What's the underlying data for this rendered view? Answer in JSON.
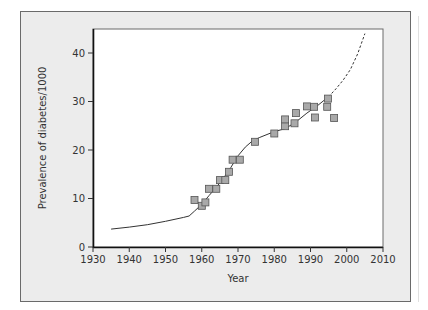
{
  "chart_data": {
    "type": "scatter",
    "title": "",
    "xlabel": "Year",
    "ylabel": "Prevalence of diabetes/1000",
    "xlim": [
      1930,
      2010
    ],
    "ylim": [
      0,
      45
    ],
    "x_ticks": [
      1930,
      1940,
      1950,
      1960,
      1970,
      1980,
      1990,
      2000,
      2010
    ],
    "y_ticks": [
      0,
      10,
      20,
      30,
      40
    ],
    "grid": false,
    "legend": null,
    "series": [
      {
        "name": "Observed prevalence",
        "kind": "scatter",
        "marker": "square",
        "color": "#a9a9a9",
        "points": [
          [
            1958,
            9.7
          ],
          [
            1960,
            8.5
          ],
          [
            1961,
            9.2
          ],
          [
            1962,
            12.0
          ],
          [
            1964,
            12.0
          ],
          [
            1965,
            13.8
          ],
          [
            1966.5,
            13.8
          ],
          [
            1967.5,
            15.5
          ],
          [
            1968.5,
            18.0
          ],
          [
            1970.5,
            18.0
          ],
          [
            1974.7,
            21.7
          ],
          [
            1980,
            23.4
          ],
          [
            1983,
            24.9
          ],
          [
            1983,
            26.3
          ],
          [
            1985.6,
            25.5
          ],
          [
            1986,
            27.6
          ],
          [
            1989,
            29.0
          ],
          [
            1991,
            28.9
          ],
          [
            1991.2,
            26.7
          ],
          [
            1994.6,
            28.9
          ],
          [
            1994.8,
            30.6
          ],
          [
            1996.5,
            26.6
          ]
        ]
      },
      {
        "name": "Trend (fitted)",
        "kind": "line",
        "style": "solid",
        "color": "#333333",
        "points": [
          [
            1935,
            3.7
          ],
          [
            1940,
            4.1
          ],
          [
            1945,
            4.6
          ],
          [
            1950,
            5.3
          ],
          [
            1955,
            6.1
          ],
          [
            1956.5,
            6.4
          ],
          [
            1958,
            7.4
          ],
          [
            1960,
            8.8
          ],
          [
            1962,
            10.6
          ],
          [
            1964,
            12.3
          ],
          [
            1966,
            14.2
          ],
          [
            1968,
            16.4
          ],
          [
            1970,
            18.8
          ],
          [
            1972,
            20.6
          ],
          [
            1974,
            21.9
          ],
          [
            1976,
            22.6
          ],
          [
            1978,
            23.2
          ],
          [
            1980,
            23.8
          ],
          [
            1983,
            24.4
          ],
          [
            1986,
            25.8
          ],
          [
            1989,
            27.6
          ],
          [
            1992,
            29.2
          ],
          [
            1995,
            31.0
          ]
        ]
      },
      {
        "name": "Projection",
        "kind": "line",
        "style": "dashed",
        "color": "#333333",
        "points": [
          [
            1995,
            31.0
          ],
          [
            1997,
            32.6
          ],
          [
            1999,
            34.4
          ],
          [
            2001,
            36.6
          ],
          [
            2003,
            39.8
          ],
          [
            2005,
            44.0
          ]
        ]
      }
    ]
  }
}
